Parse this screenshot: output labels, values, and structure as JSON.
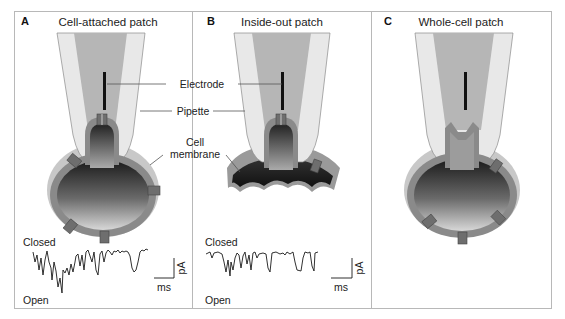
{
  "figure": {
    "panels": [
      {
        "letter": "A",
        "title": "Cell-attached patch",
        "trace": {
          "top_label": "Closed",
          "bottom_label": "Open",
          "scale_x": "ms",
          "scale_y": "pA"
        }
      },
      {
        "letter": "B",
        "title": "Inside-out patch",
        "trace": {
          "top_label": "Closed",
          "bottom_label": "Open",
          "scale_x": "ms",
          "scale_y": "pA"
        }
      },
      {
        "letter": "C",
        "title": "Whole-cell patch"
      }
    ],
    "callouts": {
      "electrode": "Electrode",
      "pipette": "Pipette",
      "cell_membrane_line1": "Cell",
      "cell_membrane_line2": "membrane"
    },
    "colors": {
      "pipette_outer": "#e6e6e6",
      "pipette_inner": "#b4b4b4",
      "membrane": "#8a8a8a",
      "cell_dark": "#222222",
      "channel": "#6e6e6e",
      "frame": "#b8b8b8"
    }
  }
}
